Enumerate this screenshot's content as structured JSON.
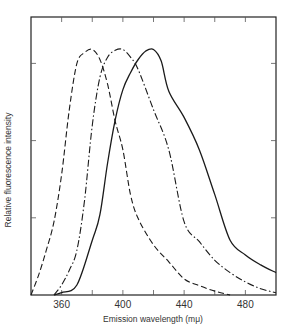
{
  "chart_data": {
    "type": "line",
    "title": "",
    "xlabel": "Emission wavelength (mμ)",
    "ylabel": "Relative fluorescence intensity",
    "xlim": [
      340,
      500
    ],
    "ylim": [
      0,
      3.6
    ],
    "x_ticks": [
      340,
      360,
      380,
      400,
      420,
      440,
      460,
      480,
      500
    ],
    "x_tick_labels": [
      "360",
      "400",
      "440",
      "480"
    ],
    "x_tick_label_values": [
      360,
      400,
      440,
      480
    ],
    "y_ticks": [
      1,
      2,
      3
    ],
    "y_tick_labels": [],
    "grid": false,
    "legend": null,
    "series": [
      {
        "name": "dashed (peak ~380 mμ)",
        "style": "dashed",
        "x": [
          340,
          345,
          350,
          355,
          360,
          365,
          370,
          375,
          380,
          385,
          390,
          395,
          400,
          405,
          410,
          420,
          430,
          440,
          450,
          460,
          470
        ],
        "y": [
          0,
          0.26,
          0.58,
          0.95,
          1.56,
          2.4,
          3.0,
          3.14,
          3.18,
          3.05,
          2.73,
          2.25,
          1.88,
          1.3,
          0.99,
          0.65,
          0.43,
          0.21,
          0.12,
          0.05,
          0
        ]
      },
      {
        "name": "dash-dot (peak ~400 mμ)",
        "style": "dashdot",
        "x": [
          355,
          360,
          365,
          370,
          375,
          380,
          385,
          390,
          395,
          400,
          405,
          410,
          420,
          430,
          440,
          450,
          460,
          470,
          480,
          490,
          500
        ],
        "y": [
          0,
          0.13,
          0.32,
          0.58,
          1.23,
          2.2,
          2.82,
          3.08,
          3.17,
          3.18,
          3.08,
          2.92,
          2.4,
          1.88,
          0.95,
          0.69,
          0.45,
          0.29,
          0.17,
          0.08,
          0.03
        ]
      },
      {
        "name": "solid (peak ~420 mμ)",
        "style": "solid",
        "x": [
          355,
          360,
          370,
          380,
          385,
          390,
          395,
          400,
          405,
          410,
          415,
          420,
          425,
          430,
          440,
          450,
          460,
          470,
          480,
          490,
          500
        ],
        "y": [
          0,
          0.03,
          0.13,
          0.71,
          1.04,
          1.71,
          2.27,
          2.66,
          2.88,
          3.05,
          3.16,
          3.18,
          3.03,
          2.64,
          2.3,
          1.88,
          1.3,
          0.71,
          0.52,
          0.39,
          0.29
        ]
      }
    ]
  }
}
